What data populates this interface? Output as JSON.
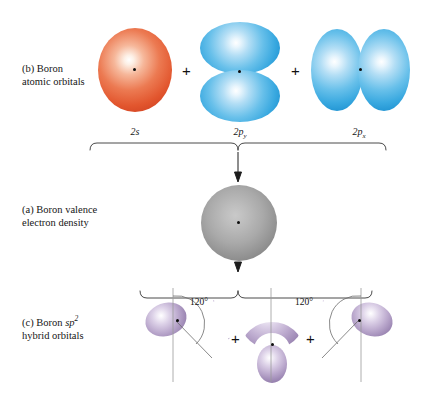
{
  "figure": {
    "rows": {
      "b": {
        "caption_line1": "(b) Boron",
        "caption_line2": "atomic orbitals",
        "orbitals": [
          {
            "label_main": "2s",
            "label_sub": "",
            "name": "2s orbital",
            "color": "#e2562e",
            "shape": "sphere"
          },
          {
            "label_main": "2p",
            "label_sub": "y",
            "name": "2py orbital",
            "color": "#3aa9e0",
            "shape": "dumbbell-vertical"
          },
          {
            "label_main": "2p",
            "label_sub": "x",
            "name": "2px orbital",
            "color": "#3aa9e0",
            "shape": "dumbbell-horizontal"
          }
        ],
        "operators": [
          "+",
          "+"
        ]
      },
      "a": {
        "caption_line1": "(a) Boron valence",
        "caption_line2": "electron density",
        "orbital": {
          "name": "valence electron density sphere",
          "color": "#8e8e8e",
          "shape": "sphere"
        }
      },
      "c": {
        "caption_line1_pre": "(c) Boron ",
        "caption_line1_italic": "sp",
        "caption_line1_sup": "2",
        "caption_line2": "hybrid orbitals",
        "angles": [
          "120°",
          "120°"
        ],
        "operators": [
          "+",
          "+"
        ],
        "orbital_color": "#9f8ab6",
        "orbital_count": 3
      }
    },
    "connectors": {
      "top_brace": "brace-down",
      "bottom_brace": "brace-up",
      "arrow_up": "arrow-up",
      "arrow_down": "arrow-down"
    },
    "colors": {
      "s_orbital": "#e2562e",
      "p_orbital": "#3aa9e0",
      "density": "#8e8e8e",
      "hybrid": "#9f8ab6",
      "line": "#4a4a4a",
      "text": "#151515"
    }
  }
}
